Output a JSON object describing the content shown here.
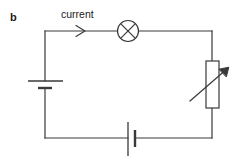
{
  "figure": {
    "part_label": "b",
    "type": "circuit-diagram",
    "background_color": "#ffffff",
    "stroke_color": "#3a3a3a",
    "text_color": "#1a1a1a"
  },
  "annotations": {
    "current_label": "current",
    "current_arrow": "arrow-right"
  },
  "components": {
    "lamp": {
      "name": "lamp",
      "symbol": "circle-with-cross"
    },
    "cell_left": {
      "name": "cell",
      "symbol": "battery-cell-horizontal-wire"
    },
    "cell_bottom": {
      "name": "cell",
      "symbol": "battery-cell-vertical-wire"
    },
    "variable_resistor": {
      "name": "variable-resistor",
      "symbol": "rectangle-with-diagonal-arrow"
    }
  },
  "geometry": {
    "canvas": {
      "width": 241,
      "height": 159
    },
    "loop": {
      "left": 45,
      "top": 31,
      "right": 212,
      "bottom": 138
    },
    "lamp": {
      "cx": 128,
      "cy": 31,
      "r": 10.5
    },
    "arrow_marker": {
      "x": 82,
      "y": 31
    },
    "cell_left": {
      "long_plate": {
        "x1": 28,
        "x2": 63,
        "y": 81
      },
      "short_plate": {
        "x1": 38,
        "x2": 52,
        "y": 88
      }
    },
    "cell_bottom": {
      "long_plate": {
        "x": 128,
        "y1": 122,
        "y2": 156
      },
      "short_plate": {
        "x": 135,
        "y1": 130,
        "y2": 147
      }
    },
    "variable_resistor": {
      "box": {
        "x": 206,
        "y": 61,
        "w": 13,
        "h": 47
      },
      "arrow": {
        "x1": 190,
        "y1": 101,
        "x2": 229,
        "y2": 67
      }
    },
    "labels": {
      "part_label": {
        "x": 10,
        "y": 12
      },
      "current_label": {
        "x": 61,
        "y": 9
      }
    }
  }
}
